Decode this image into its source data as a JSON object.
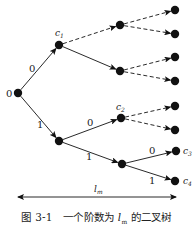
{
  "figure": {
    "root_label": "0",
    "caption": {
      "number": "图 3-1",
      "text_before": "一个阶数为 ",
      "variable": "l",
      "variable_sub": "m",
      "text_after": " 的二叉树"
    },
    "length_label": {
      "var": "l",
      "sub": "m"
    }
  },
  "nodes": [
    {
      "id": "root",
      "x": 18,
      "y": 93,
      "label": ""
    },
    {
      "id": "c1",
      "x": 59,
      "y": 45,
      "label": "c",
      "sub": "1"
    },
    {
      "id": "n1",
      "x": 59,
      "y": 141,
      "label": ""
    },
    {
      "id": "a",
      "x": 120,
      "y": 25,
      "label": ""
    },
    {
      "id": "b",
      "x": 120,
      "y": 71,
      "label": ""
    },
    {
      "id": "c2",
      "x": 121,
      "y": 118,
      "label": "c",
      "sub": "2"
    },
    {
      "id": "n2",
      "x": 122,
      "y": 164,
      "label": ""
    },
    {
      "id": "l1",
      "x": 175,
      "y": 10
    },
    {
      "id": "l2",
      "x": 175,
      "y": 34
    },
    {
      "id": "l3",
      "x": 175,
      "y": 57
    },
    {
      "id": "l4",
      "x": 175,
      "y": 81
    },
    {
      "id": "l5",
      "x": 175,
      "y": 106
    },
    {
      "id": "l6",
      "x": 175,
      "y": 130
    },
    {
      "id": "c3",
      "x": 176,
      "y": 151,
      "label": "c",
      "sub": "3"
    },
    {
      "id": "c4",
      "x": 175,
      "y": 181,
      "label": "c",
      "sub": "4"
    }
  ],
  "edges": [
    {
      "from": "root",
      "to": "c1",
      "style": "solid",
      "label": "0"
    },
    {
      "from": "root",
      "to": "n1",
      "style": "solid",
      "label": "1"
    },
    {
      "from": "c1",
      "to": "a",
      "style": "dashed"
    },
    {
      "from": "c1",
      "to": "b",
      "style": "solid"
    },
    {
      "from": "n1",
      "to": "c2",
      "style": "solid",
      "label": "0"
    },
    {
      "from": "n1",
      "to": "n2",
      "style": "solid",
      "label": "1"
    },
    {
      "from": "a",
      "to": "l1",
      "style": "dashed"
    },
    {
      "from": "a",
      "to": "l2",
      "style": "dashed"
    },
    {
      "from": "b",
      "to": "l3",
      "style": "dashed"
    },
    {
      "from": "b",
      "to": "l4",
      "style": "dashed"
    },
    {
      "from": "c2",
      "to": "l5",
      "style": "dashed"
    },
    {
      "from": "c2",
      "to": "l6",
      "style": "dashed"
    },
    {
      "from": "n2",
      "to": "c3",
      "style": "solid",
      "label": "0"
    },
    {
      "from": "n2",
      "to": "c4",
      "style": "solid",
      "label": "1"
    }
  ],
  "edge_labels": [
    {
      "text": "0",
      "x": 29,
      "y": 72
    },
    {
      "text": "1",
      "x": 37,
      "y": 128
    },
    {
      "text": "0",
      "x": 87,
      "y": 126
    },
    {
      "text": "1",
      "x": 86,
      "y": 160
    },
    {
      "text": "0",
      "x": 149,
      "y": 154
    },
    {
      "text": "1",
      "x": 149,
      "y": 184
    }
  ],
  "colors": {
    "ink": "#111111",
    "background": "#ffffff"
  }
}
